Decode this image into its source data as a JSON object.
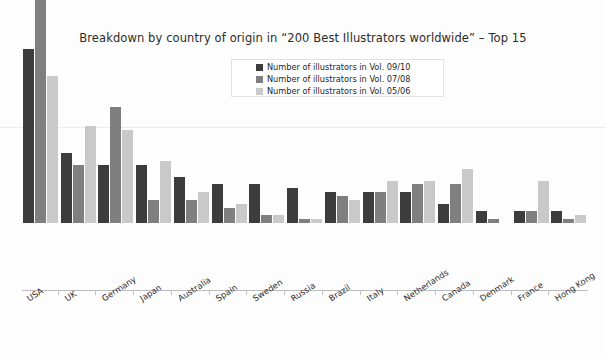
{
  "chart_data": {
    "type": "bar",
    "title": "Breakdown by country of origin in “200 Best Illustrators worldwide” – Top 15",
    "xlabel": "",
    "ylabel": "",
    "ylim": [
      0,
      66
    ],
    "grid": true,
    "legend_position": "top-center",
    "categories": [
      "USA",
      "UK",
      "Germany",
      "Japan",
      "Australia",
      "Spain",
      "Sweden",
      "Russia",
      "Brazil",
      "Italy",
      "Netherlands",
      "Canada",
      "Denmark",
      "France",
      "Hong Kong"
    ],
    "series": [
      {
        "name": "Number of illustrators in Vol. 09/10",
        "color": "#3c3c3c",
        "values": [
          45,
          18,
          15,
          15,
          12,
          10,
          10,
          9,
          8,
          8,
          8,
          5,
          3,
          3,
          3
        ]
      },
      {
        "name": "Number of illustrators in Vol. 07/08",
        "color": "#7f7f7f",
        "values": [
          63,
          15,
          30,
          6,
          6,
          4,
          2,
          1,
          7,
          8,
          10,
          10,
          1,
          3,
          1
        ]
      },
      {
        "name": "Number of illustrators in Vol. 05/06",
        "color": "#c9c9c9",
        "values": [
          38,
          25,
          24,
          16,
          8,
          5,
          2,
          1,
          6,
          11,
          11,
          14,
          0,
          11,
          2
        ]
      }
    ]
  },
  "legend": {
    "items": [
      {
        "label": "Number of illustrators in Vol. 09/10",
        "color": "#3c3c3c"
      },
      {
        "label": "Number of illustrators in Vol. 07/08",
        "color": "#7f7f7f"
      },
      {
        "label": "Number of illustrators in Vol. 05/06",
        "color": "#c9c9c9"
      }
    ]
  }
}
